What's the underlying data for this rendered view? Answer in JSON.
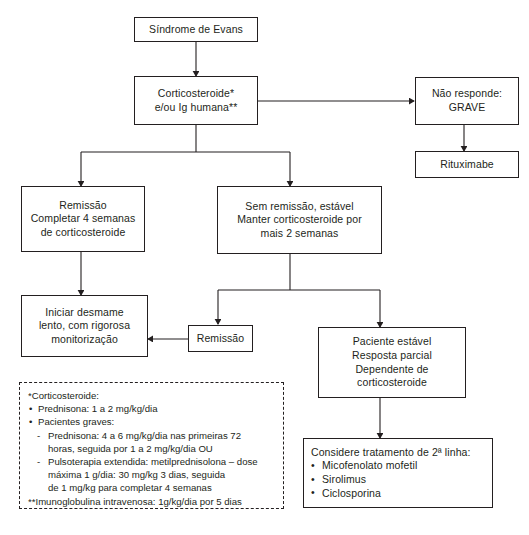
{
  "diagram": {
    "title_hidden": "Fluxograma Sindrome de Evans",
    "nodes": {
      "evans": {
        "lines": [
          "Síndrome de Evans"
        ]
      },
      "cortico": {
        "lines": [
          "Corticosteroide*",
          "e/ou Ig humana**"
        ]
      },
      "nao_responde": {
        "lines": [
          "Não responde:",
          "GRAVE"
        ]
      },
      "rituximabe": {
        "lines": [
          "Rituximabe"
        ]
      },
      "remissao_completar": {
        "lines": [
          "Remissão",
          "Completar 4 semanas",
          "de corticosteroide"
        ]
      },
      "sem_remissao": {
        "lines": [
          "Sem remissão, estável",
          "Manter corticosteroide por",
          "mais 2 semanas"
        ]
      },
      "iniciar_desmame": {
        "lines": [
          "Iniciar desmame",
          "lento, com rigorosa",
          "monitorização"
        ]
      },
      "remissao": {
        "lines": [
          "Remissão"
        ]
      },
      "paciente_estavel": {
        "lines": [
          "Paciente estável",
          "Resposta parcial",
          "Dependente de",
          "corticosteroide"
        ]
      },
      "segunda_linha": {
        "header": "Considere tratamento de 2ª linha:",
        "items": [
          "Micofenolato mofetil",
          "Sirolimus",
          "Ciclosporina"
        ]
      }
    },
    "legend": {
      "lines": [
        {
          "kind": "plain",
          "text": "*Corticosteroide:"
        },
        {
          "kind": "bullet",
          "text": "Prednisona: 1 a 2 mg/kg/dia"
        },
        {
          "kind": "bullet",
          "text": "Pacientes graves:"
        },
        {
          "kind": "dash",
          "text": "Prednisona: 4 a 6 mg/kg/dia nas primeiras 72"
        },
        {
          "kind": "cont",
          "text": "horas, seguida por 1 a 2 mg/kg/dia OU"
        },
        {
          "kind": "dash",
          "text": "Pulsoterapia extendida: metilprednisolona – dose"
        },
        {
          "kind": "cont",
          "text": "máxima 1 g/dia: 30 mg/kg 3 dias, seguida"
        },
        {
          "kind": "cont",
          "text": "de 1 mg/kg para completar 4 semanas"
        },
        {
          "kind": "plain",
          "text": "**Imunoglobulina intravenosa: 1g/kg/dia por 5 dias"
        }
      ]
    },
    "colors": {
      "stroke": "#231f20",
      "background": "#ffffff"
    }
  }
}
